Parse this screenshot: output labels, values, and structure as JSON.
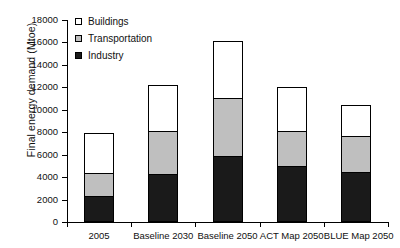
{
  "chart_data": {
    "type": "bar",
    "subtype": "stacked-bar",
    "title": "",
    "xlabel": "",
    "ylabel": "Final energy demand (Mtoe)",
    "ylim": [
      0,
      18000
    ],
    "ytick_step": 2000,
    "ytick_labels": [
      "0",
      "2000",
      "4000",
      "6000",
      "8000",
      "10000",
      "12000",
      "14000",
      "16000",
      "18000"
    ],
    "ytick_values": [
      0,
      2000,
      4000,
      6000,
      8000,
      10000,
      12000,
      14000,
      16000,
      18000
    ],
    "grid": false,
    "legend_position": "top-left",
    "categories": [
      "2005",
      "Baseline 2030",
      "Baseline 2050",
      "ACT Map 2050",
      "BLUE Map 2050"
    ],
    "series": [
      {
        "name": "Industry",
        "color": "#1a1a1a",
        "values": [
          2200,
          4200,
          5800,
          4900,
          4400
        ]
      },
      {
        "name": "Transportation",
        "color": "#bfbfbf",
        "values": [
          2100,
          3800,
          5200,
          3100,
          3200
        ]
      },
      {
        "name": "Buildings",
        "color": "#ffffff",
        "values": [
          3500,
          4100,
          5000,
          3900,
          2700
        ]
      }
    ],
    "stack_order_bottom_to_top": [
      "Industry",
      "Transportation",
      "Buildings"
    ],
    "totals": [
      7800,
      12100,
      16000,
      11900,
      10300
    ]
  },
  "legend": {
    "items": [
      {
        "label": "Buildings",
        "color": "#ffffff"
      },
      {
        "label": "Transportation",
        "color": "#bfbfbf"
      },
      {
        "label": "Industry",
        "color": "#1a1a1a"
      }
    ]
  },
  "axes": {
    "y_title": "Final energy demand (Mtoe)"
  }
}
